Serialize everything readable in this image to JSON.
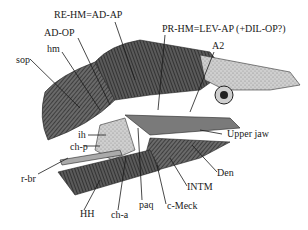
{
  "figure": {
    "labels": {
      "re_hm": "RE-HM=AD-AP",
      "ad_op": "AD-OP",
      "hm": "hm",
      "sop": "sop",
      "pr_hm": "PR-HM=LEV-AP (+DIL-OP?)",
      "a2": "A2",
      "ih": "ih",
      "ch_p": "ch-p",
      "r_br": "r-br",
      "hh": "HH",
      "ch_a": "ch-a",
      "paq": "paq",
      "upper_jaw": "Upper jaw",
      "den": "Den",
      "intm": "INTM",
      "c_meck": "c-Meck"
    }
  }
}
